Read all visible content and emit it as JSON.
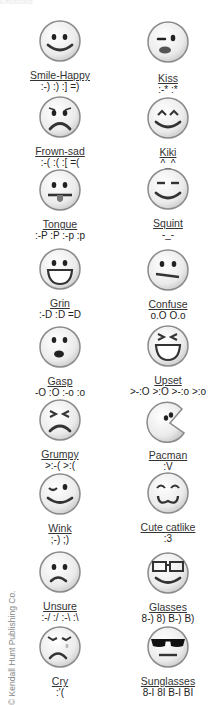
{
  "header": {
    "title": "Emoticons"
  },
  "emoticons": [
    {
      "name": "Smile-Happy",
      "codes": ":-) :) :] =)",
      "icon": "smile-happy-face-icon"
    },
    {
      "name": "Kiss",
      "codes": ":-* :*",
      "icon": "kiss-face-icon"
    },
    {
      "name": "Frown-sad",
      "codes": ":-( :( :[ =(",
      "icon": "frown-sad-face-icon"
    },
    {
      "name": "Kiki",
      "codes": "^_^",
      "icon": "kiki-face-icon"
    },
    {
      "name": "Tongue",
      "codes": ":-P :P :-p :p",
      "icon": "tongue-face-icon"
    },
    {
      "name": "Squint",
      "codes": "-_-",
      "icon": "squint-face-icon"
    },
    {
      "name": "Grin",
      "codes": ":-D :D =D",
      "icon": "grin-face-icon"
    },
    {
      "name": "Confuse",
      "codes": "o.O O.o",
      "icon": "confuse-face-icon"
    },
    {
      "name": "Gasp",
      "codes": "-O :O :-o :o",
      "icon": "gasp-face-icon"
    },
    {
      "name": "Upset",
      "codes": ">-:O >:O >-:o >:o",
      "icon": "upset-face-icon"
    },
    {
      "name": "Grumpy",
      "codes": ">:-( >:(",
      "icon": "grumpy-face-icon"
    },
    {
      "name": "Pacman",
      "codes": ":V",
      "icon": "pacman-face-icon"
    },
    {
      "name": "Wink",
      "codes": ";-) ;)",
      "icon": "wink-face-icon"
    },
    {
      "name": "Cute catlike",
      "codes": ":3",
      "icon": "cute-catlike-face-icon"
    },
    {
      "name": "Unsure",
      "codes": ":-/ :/ :-\\ :\\",
      "icon": "unsure-face-icon"
    },
    {
      "name": "Glasses",
      "codes": "8-) 8) B-) B)",
      "icon": "glasses-face-icon"
    },
    {
      "name": "Cry",
      "codes": ":'(",
      "icon": "cry-face-icon"
    },
    {
      "name": "Sunglasses",
      "codes": "8-I 8I B-I BI",
      "icon": "sunglasses-face-icon"
    }
  ],
  "credit": "© Kendall Hunt Publishing Co.",
  "colors": {
    "face_fill": "#ececec",
    "face_stroke": "#8a8a8a",
    "feature": "#222222",
    "tongue": "#777777",
    "lips": "#555555"
  }
}
